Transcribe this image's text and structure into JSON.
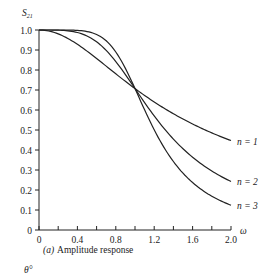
{
  "chart_data": {
    "type": "line",
    "title": "",
    "caption": "(a) Amplitude response",
    "caption_prefix": "(a)",
    "caption_text": "Amplitude response",
    "ylabel": "S21",
    "ylabel_main": "S",
    "ylabel_sub": "21",
    "xlabel": "ω",
    "next_label": "θ°",
    "xlim": [
      0,
      2.0
    ],
    "ylim": [
      0,
      1.0
    ],
    "x_ticks": [
      0,
      0.4,
      0.8,
      1.2,
      1.6,
      2.0
    ],
    "x_tick_labels": [
      "0",
      "0.4",
      "0.8",
      "1.2",
      "1.6",
      "2.0"
    ],
    "x_minor_ticks": [
      0.2,
      0.6,
      1.0,
      1.4,
      1.8
    ],
    "y_ticks": [
      0,
      0.1,
      0.2,
      0.3,
      0.4,
      0.5,
      0.6,
      0.7,
      0.8,
      0.9,
      1.0
    ],
    "y_tick_labels": [
      "0",
      "0.1",
      "0.2",
      "0.3",
      "0.4",
      "0.5",
      "0.6",
      "0.7",
      "0.8",
      "0.9",
      "1.0"
    ],
    "grid": false,
    "legend_position": "inline-right",
    "x": [
      0,
      0.2,
      0.4,
      0.6,
      0.8,
      1.0,
      1.2,
      1.4,
      1.6,
      1.8,
      2.0
    ],
    "series": [
      {
        "name": "n = 1",
        "values": [
          1.0,
          0.981,
          0.928,
          0.857,
          0.781,
          0.707,
          0.64,
          0.581,
          0.53,
          0.486,
          0.447
        ]
      },
      {
        "name": "n = 2",
        "values": [
          1.0,
          0.999,
          0.987,
          0.941,
          0.842,
          0.707,
          0.57,
          0.455,
          0.364,
          0.295,
          0.243
        ]
      },
      {
        "name": "n = 3",
        "values": [
          1.0,
          1.0,
          0.998,
          0.977,
          0.888,
          0.707,
          0.501,
          0.342,
          0.237,
          0.169,
          0.124
        ]
      }
    ]
  }
}
